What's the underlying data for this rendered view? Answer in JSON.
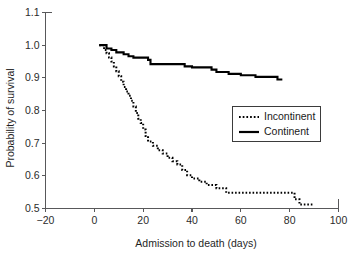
{
  "chart_data": {
    "type": "line",
    "title": "",
    "xlabel": "Admission to death (days)",
    "ylabel": "Probability of survival",
    "xlim": [
      -20,
      100
    ],
    "ylim": [
      0.5,
      1.1
    ],
    "xticks": [
      -20,
      0,
      20,
      40,
      60,
      80,
      100
    ],
    "xtick_labels": [
      "−20",
      "0",
      "20",
      "40",
      "60",
      "80",
      "100"
    ],
    "yticks": [
      0.5,
      0.6,
      0.7,
      0.8,
      0.9,
      1.0,
      1.1
    ],
    "ytick_labels": [
      "0.5",
      "0.6",
      "0.7",
      "0.8",
      "0.9",
      "1.0",
      "1.1"
    ],
    "grid": false,
    "legend_position": "center-right",
    "plot_style": "kaplan-meier step survival curves",
    "series": [
      {
        "name": "Incontinent",
        "line_style": "dotted",
        "color": "#000000",
        "points": [
          [
            2,
            1.0
          ],
          [
            4,
            1.0
          ],
          [
            4,
            0.985
          ],
          [
            5,
            0.985
          ],
          [
            5,
            0.975
          ],
          [
            6,
            0.975
          ],
          [
            6,
            0.962
          ],
          [
            7,
            0.962
          ],
          [
            7,
            0.95
          ],
          [
            8,
            0.95
          ],
          [
            8,
            0.935
          ],
          [
            9,
            0.935
          ],
          [
            9,
            0.92
          ],
          [
            10,
            0.92
          ],
          [
            10,
            0.905
          ],
          [
            11,
            0.905
          ],
          [
            11,
            0.888
          ],
          [
            12,
            0.888
          ],
          [
            12,
            0.872
          ],
          [
            13,
            0.872
          ],
          [
            13,
            0.858
          ],
          [
            14,
            0.858
          ],
          [
            14,
            0.845
          ],
          [
            15,
            0.845
          ],
          [
            15,
            0.83
          ],
          [
            16,
            0.83
          ],
          [
            16,
            0.812
          ],
          [
            17,
            0.812
          ],
          [
            17,
            0.792
          ],
          [
            18,
            0.792
          ],
          [
            18,
            0.775
          ],
          [
            19,
            0.775
          ],
          [
            19,
            0.762
          ],
          [
            20,
            0.762
          ],
          [
            20,
            0.742
          ],
          [
            21,
            0.742
          ],
          [
            21,
            0.722
          ],
          [
            22,
            0.722
          ],
          [
            22,
            0.705
          ],
          [
            24,
            0.705
          ],
          [
            24,
            0.692
          ],
          [
            26,
            0.692
          ],
          [
            26,
            0.678
          ],
          [
            28,
            0.678
          ],
          [
            28,
            0.668
          ],
          [
            30,
            0.668
          ],
          [
            30,
            0.655
          ],
          [
            32,
            0.655
          ],
          [
            32,
            0.645
          ],
          [
            34,
            0.645
          ],
          [
            34,
            0.635
          ],
          [
            36,
            0.635
          ],
          [
            36,
            0.618
          ],
          [
            38,
            0.618
          ],
          [
            38,
            0.602
          ],
          [
            40,
            0.602
          ],
          [
            40,
            0.592
          ],
          [
            43,
            0.592
          ],
          [
            43,
            0.582
          ],
          [
            46,
            0.582
          ],
          [
            46,
            0.572
          ],
          [
            50,
            0.572
          ],
          [
            50,
            0.562
          ],
          [
            54,
            0.562
          ],
          [
            54,
            0.548
          ],
          [
            82,
            0.548
          ],
          [
            82,
            0.528
          ],
          [
            84,
            0.528
          ],
          [
            84,
            0.512
          ],
          [
            90,
            0.512
          ]
        ]
      },
      {
        "name": "Continent",
        "line_style": "solid",
        "color": "#000000",
        "points": [
          [
            2,
            1.0
          ],
          [
            5,
            1.0
          ],
          [
            5,
            0.99
          ],
          [
            7,
            0.99
          ],
          [
            7,
            0.985
          ],
          [
            9,
            0.985
          ],
          [
            9,
            0.978
          ],
          [
            12,
            0.978
          ],
          [
            12,
            0.972
          ],
          [
            14,
            0.972
          ],
          [
            14,
            0.966
          ],
          [
            16,
            0.966
          ],
          [
            16,
            0.962
          ],
          [
            22,
            0.962
          ],
          [
            22,
            0.955
          ],
          [
            23,
            0.955
          ],
          [
            23,
            0.942
          ],
          [
            37,
            0.942
          ],
          [
            37,
            0.935
          ],
          [
            40,
            0.935
          ],
          [
            40,
            0.932
          ],
          [
            48,
            0.932
          ],
          [
            48,
            0.925
          ],
          [
            50,
            0.925
          ],
          [
            50,
            0.918
          ],
          [
            55,
            0.918
          ],
          [
            55,
            0.912
          ],
          [
            60,
            0.912
          ],
          [
            60,
            0.908
          ],
          [
            66,
            0.908
          ],
          [
            66,
            0.903
          ],
          [
            75,
            0.903
          ],
          [
            75,
            0.895
          ],
          [
            77,
            0.895
          ]
        ]
      }
    ],
    "legend": [
      {
        "label": "Incontinent",
        "line_style": "dotted"
      },
      {
        "label": "Continent",
        "line_style": "solid"
      }
    ]
  }
}
